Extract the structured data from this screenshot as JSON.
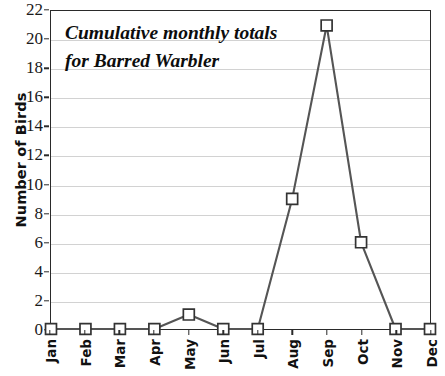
{
  "chart_data": {
    "type": "line",
    "title": "Cumulative monthly totals for Barred Warbler",
    "title_lines": [
      "Cumulative monthly totals",
      "for Barred Warbler"
    ],
    "xlabel": "",
    "ylabel": "Number of Birds",
    "categories": [
      "Jan",
      "Feb",
      "Mar",
      "Apr",
      "May",
      "Jun",
      "Jul",
      "Aug",
      "Sep",
      "Oct",
      "Nov",
      "Dec"
    ],
    "values": [
      0,
      0,
      0,
      0,
      1,
      0,
      0,
      9,
      21,
      6,
      0,
      0
    ],
    "series": [
      {
        "name": "Barred Warbler",
        "values": [
          0,
          0,
          0,
          0,
          1,
          0,
          0,
          9,
          21,
          6,
          0,
          0
        ]
      }
    ],
    "ylim": [
      0,
      22
    ],
    "ytick_step": 2,
    "yticks": [
      0,
      2,
      4,
      6,
      8,
      10,
      12,
      14,
      16,
      18,
      20,
      22
    ],
    "ytick_labels": [
      "0",
      "2",
      "4",
      "6",
      "8",
      "10",
      "12",
      "14",
      "16",
      "18",
      "20",
      "22"
    ],
    "grid": "horizontal",
    "legend": "none",
    "marker": "open-square",
    "colors": {
      "line": "#555555",
      "marker_fill": "#ffffff",
      "marker_stroke": "#333333",
      "gridline": "#d2d2d2",
      "axis": "#2a2a2a",
      "text": "#111111",
      "background": "#ffffff"
    }
  }
}
